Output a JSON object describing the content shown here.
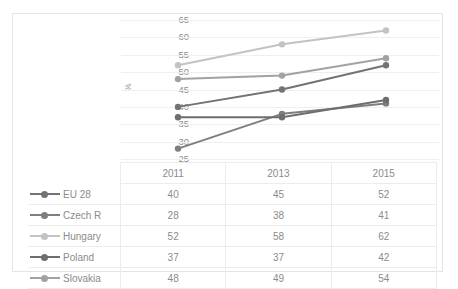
{
  "chart_data": {
    "type": "line",
    "title": "",
    "xlabel": "",
    "ylabel": "%",
    "categories": [
      "2011",
      "2013",
      "2015"
    ],
    "ylim": [
      25,
      65
    ],
    "ytick_step": 5,
    "yticks": [
      65,
      60,
      55,
      50,
      45,
      40,
      35,
      30,
      25
    ],
    "grid": true,
    "legend_position": "table-left",
    "series": [
      {
        "name": "EU 28",
        "values": [
          40,
          45,
          52
        ],
        "color": "#737373"
      },
      {
        "name": "Czech R",
        "values": [
          28,
          38,
          41
        ],
        "color": "#7e7e7e"
      },
      {
        "name": "Hungary",
        "values": [
          52,
          58,
          62
        ],
        "color": "#c3c3c3"
      },
      {
        "name": "Poland",
        "values": [
          37,
          37,
          42
        ],
        "color": "#6e6e6e"
      },
      {
        "name": "Slovakia",
        "values": [
          48,
          49,
          54
        ],
        "color": "#a2a2a2"
      }
    ]
  },
  "table": {
    "header_corner_label": "",
    "year_headers": [
      "2011",
      "2013",
      "2015"
    ],
    "rows": [
      {
        "label": "EU 28",
        "values": [
          "40",
          "45",
          "52"
        ]
      },
      {
        "label": "Czech R",
        "values": [
          "28",
          "38",
          "41"
        ]
      },
      {
        "label": "Hungary",
        "values": [
          "52",
          "58",
          "62"
        ]
      },
      {
        "label": "Poland",
        "values": [
          "37",
          "37",
          "42"
        ]
      },
      {
        "label": "Slovakia",
        "values": [
          "48",
          "49",
          "54"
        ]
      }
    ]
  },
  "axis": {
    "y_title": "%",
    "y_tick_labels": [
      "65",
      "60",
      "55",
      "50",
      "45",
      "40",
      "35",
      "30",
      "25"
    ]
  },
  "colors": {
    "frame_border": "#e4e4e4",
    "gridline": "#efefef",
    "table_border": "#ececec",
    "text": "#8b8b8b",
    "tick_text": "#8e8e8e"
  }
}
